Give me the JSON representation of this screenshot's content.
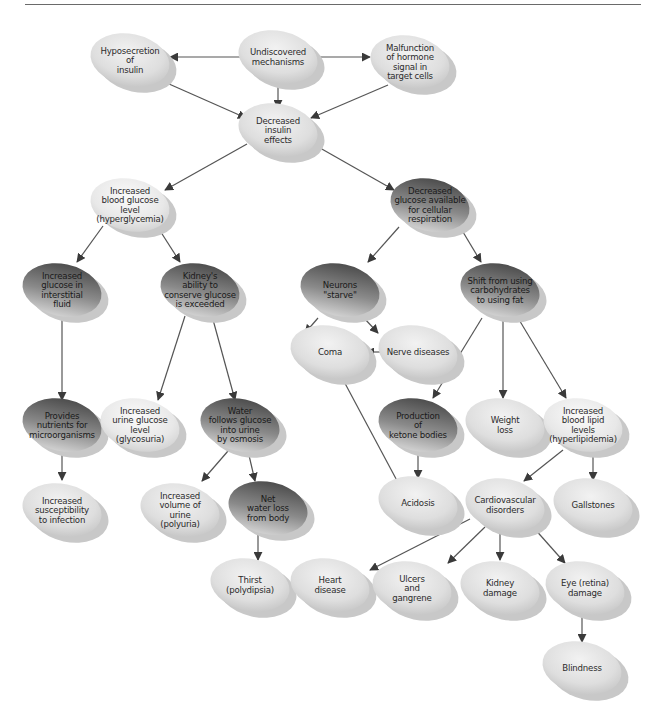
{
  "diagram": {
    "type": "flowchart",
    "title": "",
    "colors": {
      "light_node": "#e4e4e4",
      "dark_node": "#6a6a6a",
      "shadow": "#c8c8c8",
      "edge": "#555555",
      "text": "#2b2b2b"
    },
    "nodes": [
      {
        "id": "hyposecretion",
        "lines": [
          "Hyposecretion",
          "of",
          "insulin"
        ],
        "style": "light",
        "x": 130,
        "y": 60
      },
      {
        "id": "undiscovered",
        "lines": [
          "Undiscovered",
          "mechanisms"
        ],
        "style": "light",
        "x": 278,
        "y": 57
      },
      {
        "id": "malfunction",
        "lines": [
          "Malfunction",
          "of hormone",
          "signal in",
          "target cells"
        ],
        "style": "light",
        "x": 410,
        "y": 62
      },
      {
        "id": "decreased_insulin",
        "lines": [
          "Decreased",
          "insulin",
          "effects"
        ],
        "style": "light",
        "x": 278,
        "y": 130
      },
      {
        "id": "blood_glucose",
        "lines": [
          "Increased",
          "blood glucose",
          "level",
          "(hyperglycemia)"
        ],
        "style": "lighter",
        "x": 130,
        "y": 205
      },
      {
        "id": "glucose_available",
        "lines": [
          "Decreased",
          "glucose available",
          "for cellular",
          "respiration"
        ],
        "style": "dark",
        "x": 430,
        "y": 205
      },
      {
        "id": "interstitial",
        "lines": [
          "Increased",
          "glucose in",
          "interstitial",
          "fluid"
        ],
        "style": "dark",
        "x": 62,
        "y": 290
      },
      {
        "id": "kidney_ability",
        "lines": [
          "Kidney's",
          "ability to",
          "conserve glucose",
          "is exceeded"
        ],
        "style": "dark",
        "x": 200,
        "y": 290
      },
      {
        "id": "neurons",
        "lines": [
          "Neurons",
          "\"starve\""
        ],
        "style": "dark",
        "x": 340,
        "y": 290
      },
      {
        "id": "shift",
        "lines": [
          "Shift from using",
          "carbohydrates",
          "to using fat"
        ],
        "style": "dark",
        "x": 500,
        "y": 290
      },
      {
        "id": "coma",
        "lines": [
          "Coma"
        ],
        "style": "light",
        "x": 330,
        "y": 352
      },
      {
        "id": "nerve",
        "lines": [
          "Nerve diseases"
        ],
        "style": "light",
        "x": 418,
        "y": 352
      },
      {
        "id": "nutrients",
        "lines": [
          "Provides",
          "nutrients for",
          "microorganisms"
        ],
        "style": "dark",
        "x": 62,
        "y": 425
      },
      {
        "id": "urine_glucose",
        "lines": [
          "Increased",
          "urine glucose",
          "level",
          "(glycosuria)"
        ],
        "style": "lighter",
        "x": 140,
        "y": 425
      },
      {
        "id": "water_follows",
        "lines": [
          "Water",
          "follows glucose",
          "into urine",
          "by osmosis"
        ],
        "style": "dark",
        "x": 240,
        "y": 425
      },
      {
        "id": "ketone",
        "lines": [
          "Production",
          "of",
          "ketone bodies"
        ],
        "style": "dark",
        "x": 418,
        "y": 425
      },
      {
        "id": "weight",
        "lines": [
          "Weight",
          "loss"
        ],
        "style": "light",
        "x": 505,
        "y": 425
      },
      {
        "id": "lipid",
        "lines": [
          "Increased",
          "blood lipid",
          "levels",
          "(hyperlipidemia)"
        ],
        "style": "lighter",
        "x": 583,
        "y": 425
      },
      {
        "id": "susceptibility",
        "lines": [
          "Increased",
          "susceptibility",
          "to infection"
        ],
        "style": "light",
        "x": 62,
        "y": 510
      },
      {
        "id": "volume_urine",
        "lines": [
          "Increased",
          "volume of",
          "urine",
          "(polyuria)"
        ],
        "style": "light",
        "x": 180,
        "y": 510
      },
      {
        "id": "net_water",
        "lines": [
          "Net",
          "water loss",
          "from body"
        ],
        "style": "dark",
        "x": 268,
        "y": 508
      },
      {
        "id": "acidosis",
        "lines": [
          "Acidosis"
        ],
        "style": "light",
        "x": 418,
        "y": 503
      },
      {
        "id": "cardio",
        "lines": [
          "Cardiovascular",
          "disorders"
        ],
        "style": "light",
        "x": 505,
        "y": 505
      },
      {
        "id": "gallstones",
        "lines": [
          "Gallstones"
        ],
        "style": "light",
        "x": 593,
        "y": 505
      },
      {
        "id": "thirst",
        "lines": [
          "Thirst",
          "(polydipsia)"
        ],
        "style": "light",
        "x": 250,
        "y": 585
      },
      {
        "id": "heart",
        "lines": [
          "Heart",
          "disease"
        ],
        "style": "light",
        "x": 330,
        "y": 585
      },
      {
        "id": "ulcers",
        "lines": [
          "Ulcers",
          "and",
          "gangrene"
        ],
        "style": "light",
        "x": 412,
        "y": 588
      },
      {
        "id": "kidney_damage",
        "lines": [
          "Kidney",
          "damage"
        ],
        "style": "light",
        "x": 500,
        "y": 588
      },
      {
        "id": "eye",
        "lines": [
          "Eye (retina)",
          "damage"
        ],
        "style": "light",
        "x": 585,
        "y": 588
      },
      {
        "id": "blindness",
        "lines": [
          "Blindness"
        ],
        "style": "light",
        "x": 582,
        "y": 668
      }
    ],
    "edges": [
      {
        "from": "undiscovered",
        "to": "hyposecretion",
        "path": [
          [
            243,
            57
          ],
          [
            170,
            57
          ]
        ]
      },
      {
        "from": "undiscovered",
        "to": "malfunction",
        "path": [
          [
            313,
            57
          ],
          [
            370,
            57
          ]
        ]
      },
      {
        "from": "undiscovered",
        "to": "decreased_insulin",
        "path": [
          [
            278,
            84
          ],
          [
            278,
            108
          ]
        ]
      },
      {
        "from": "hyposecretion",
        "to": "decreased_insulin",
        "path": [
          [
            160,
            80
          ],
          [
            246,
            118
          ]
        ]
      },
      {
        "from": "malfunction",
        "to": "decreased_insulin",
        "path": [
          [
            388,
            85
          ],
          [
            311,
            118
          ]
        ]
      },
      {
        "from": "decreased_insulin",
        "to": "blood_glucose",
        "path": [
          [
            247,
            144
          ],
          [
            165,
            190
          ]
        ]
      },
      {
        "from": "decreased_insulin",
        "to": "glucose_available",
        "path": [
          [
            313,
            144
          ],
          [
            394,
            190
          ]
        ]
      },
      {
        "from": "blood_glucose",
        "to": "interstitial",
        "path": [
          [
            103,
            226
          ],
          [
            77,
            262
          ]
        ]
      },
      {
        "from": "blood_glucose",
        "to": "kidney_ability",
        "path": [
          [
            157,
            226
          ],
          [
            180,
            262
          ]
        ]
      },
      {
        "from": "glucose_available",
        "to": "neurons",
        "path": [
          [
            399,
            227
          ],
          [
            368,
            262
          ]
        ]
      },
      {
        "from": "glucose_available",
        "to": "shift",
        "path": [
          [
            460,
            227
          ],
          [
            481,
            262
          ]
        ]
      },
      {
        "from": "neurons",
        "to": "coma",
        "path": [
          [
            318,
            318
          ],
          [
            305,
            333
          ]
        ]
      },
      {
        "from": "neurons",
        "to": "nerve",
        "path": [
          [
            364,
            318
          ],
          [
            378,
            333
          ]
        ]
      },
      {
        "from": "nerve",
        "to": "coma",
        "path": [
          [
            380,
            352
          ],
          [
            366,
            352
          ]
        ]
      },
      {
        "from": "interstitial",
        "to": "nutrients",
        "path": [
          [
            62,
            316
          ],
          [
            62,
            400
          ]
        ]
      },
      {
        "from": "kidney_ability",
        "to": "urine_glucose",
        "path": [
          [
            185,
            316
          ],
          [
            158,
            400
          ]
        ]
      },
      {
        "from": "kidney_ability",
        "to": "water_follows",
        "path": [
          [
            212,
            316
          ],
          [
            235,
            400
          ]
        ]
      },
      {
        "from": "shift",
        "to": "ketone",
        "path": [
          [
            482,
            318
          ],
          [
            433,
            398
          ]
        ]
      },
      {
        "from": "shift",
        "to": "weight",
        "path": [
          [
            503,
            318
          ],
          [
            503,
            398
          ]
        ]
      },
      {
        "from": "shift",
        "to": "lipid",
        "path": [
          [
            518,
            318
          ],
          [
            566,
            398
          ]
        ]
      },
      {
        "from": "acidosis",
        "to": "coma",
        "path": [
          [
            402,
            490
          ],
          [
            340,
            374
          ]
        ]
      },
      {
        "from": "nutrients",
        "to": "susceptibility",
        "path": [
          [
            62,
            451
          ],
          [
            62,
            480
          ]
        ]
      },
      {
        "from": "water_follows",
        "to": "volume_urine",
        "path": [
          [
            228,
            451
          ],
          [
            202,
            481
          ]
        ]
      },
      {
        "from": "water_follows",
        "to": "net_water",
        "path": [
          [
            248,
            451
          ],
          [
            255,
            481
          ]
        ]
      },
      {
        "from": "ketone",
        "to": "acidosis",
        "path": [
          [
            418,
            451
          ],
          [
            418,
            478
          ]
        ]
      },
      {
        "from": "lipid",
        "to": "cardio",
        "path": [
          [
            563,
            450
          ],
          [
            524,
            481
          ]
        ]
      },
      {
        "from": "lipid",
        "to": "gallstones",
        "path": [
          [
            593,
            452
          ],
          [
            593,
            480
          ]
        ]
      },
      {
        "from": "net_water",
        "to": "thirst",
        "path": [
          [
            258,
            533
          ],
          [
            258,
            560
          ]
        ]
      },
      {
        "from": "cardio",
        "to": "heart",
        "path": [
          [
            470,
            519
          ],
          [
            370,
            570
          ]
        ]
      },
      {
        "from": "cardio",
        "to": "ulcers",
        "path": [
          [
            485,
            527
          ],
          [
            448,
            563
          ]
        ]
      },
      {
        "from": "cardio",
        "to": "kidney_damage",
        "path": [
          [
            500,
            531
          ],
          [
            500,
            560
          ]
        ]
      },
      {
        "from": "cardio",
        "to": "eye",
        "path": [
          [
            533,
            527
          ],
          [
            565,
            563
          ]
        ]
      },
      {
        "from": "eye",
        "to": "blindness",
        "path": [
          [
            582,
            614
          ],
          [
            582,
            642
          ]
        ]
      }
    ]
  }
}
